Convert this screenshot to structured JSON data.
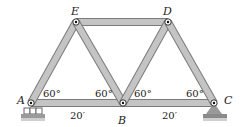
{
  "diagram": {
    "type": "truss",
    "colors": {
      "member_fill": "#c4c4c4",
      "member_edge": "#7a7a7a",
      "support": "#8a8a8a",
      "ground": "#9a9a9a"
    },
    "joints": [
      {
        "id": "A",
        "label": "A",
        "x": 31,
        "y": 103
      },
      {
        "id": "B",
        "label": "B",
        "x": 123,
        "y": 103
      },
      {
        "id": "C",
        "label": "C",
        "x": 214,
        "y": 103
      },
      {
        "id": "D",
        "label": "D",
        "x": 168,
        "y": 22
      },
      {
        "id": "E",
        "label": "E",
        "x": 76,
        "y": 22
      }
    ],
    "members": [
      [
        "A",
        "B"
      ],
      [
        "B",
        "C"
      ],
      [
        "E",
        "D"
      ],
      [
        "A",
        "E"
      ],
      [
        "E",
        "B"
      ],
      [
        "B",
        "D"
      ],
      [
        "D",
        "C"
      ]
    ],
    "angles": [
      {
        "label": "60°",
        "x": 43,
        "y": 97
      },
      {
        "label": "60°",
        "x": 95,
        "y": 97
      },
      {
        "label": "60°",
        "x": 134,
        "y": 97
      },
      {
        "label": "60°",
        "x": 186,
        "y": 97
      }
    ],
    "dimensions": [
      {
        "label": "20′",
        "x": 70,
        "y": 119
      },
      {
        "label": "20′",
        "x": 162,
        "y": 119
      }
    ],
    "supports": [
      {
        "joint": "A",
        "type": "roller"
      },
      {
        "joint": "C",
        "type": "pin"
      }
    ]
  }
}
